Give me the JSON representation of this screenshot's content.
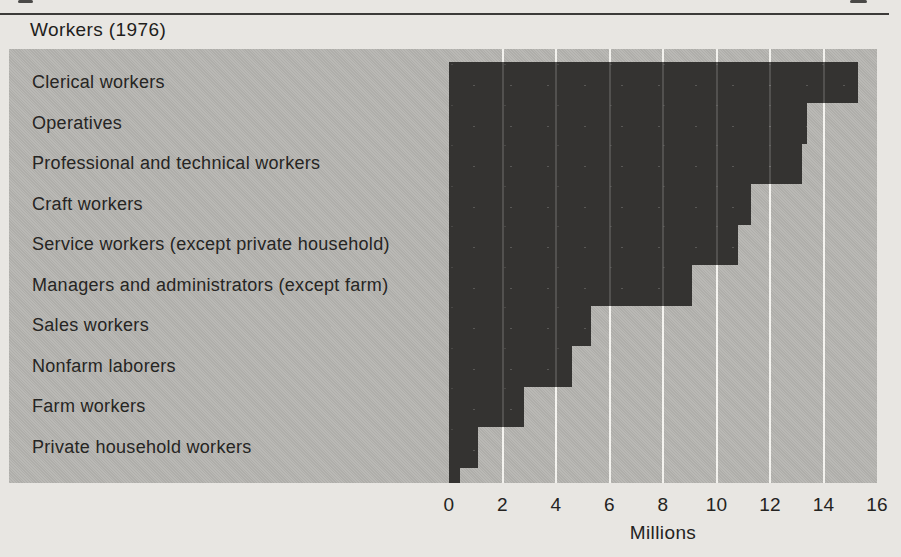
{
  "chart_data": {
    "type": "bar",
    "orientation": "horizontal",
    "title": "Workers (1976)",
    "categories": [
      "Clerical workers",
      "Operatives",
      "Professional and technical workers",
      "Craft workers",
      "Service workers (except private household)",
      "Managers and administrators (except farm)",
      "Sales workers",
      "Nonfarm laborers",
      "Farm workers",
      "Private household workers"
    ],
    "values": [
      15.3,
      13.4,
      13.2,
      11.3,
      10.8,
      9.1,
      5.3,
      4.6,
      2.8,
      1.1
    ],
    "xlabel": "Millions",
    "xlim": [
      0,
      16
    ],
    "xticks": [
      0,
      2,
      4,
      6,
      8,
      10,
      12,
      14,
      16
    ],
    "grid": "vertical white gridlines at even values, faint where crossing bars",
    "legend": "none",
    "colors": {
      "bar": "#343331",
      "plot_background": "#b6b5b1",
      "page_background": "#e8e6e2",
      "gridline": "#f2f1ed",
      "text": "#22211f"
    }
  }
}
